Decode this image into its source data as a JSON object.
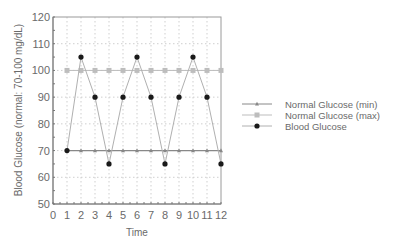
{
  "chart_data": {
    "type": "line",
    "title": "",
    "xlabel": "Time",
    "ylabel": "Blood Glucose (normal: 70-100 mg/dL)",
    "xlim": [
      0,
      12
    ],
    "ylim": [
      50,
      120
    ],
    "x_ticks": [
      "0",
      "1",
      "2",
      "3",
      "4",
      "5",
      "6",
      "7",
      "8",
      "9",
      "10",
      "11",
      "12"
    ],
    "y_ticks": [
      "50",
      "60",
      "70",
      "80",
      "90",
      "100",
      "110",
      "120"
    ],
    "grid": true,
    "legend_position": "right",
    "x": [
      1,
      2,
      3,
      4,
      5,
      6,
      7,
      8,
      9,
      10,
      11,
      12
    ],
    "series": [
      {
        "name": "Normal Glucose (min)",
        "color": "#888888",
        "marker": "triangle",
        "values": [
          70,
          70,
          70,
          70,
          70,
          70,
          70,
          70,
          70,
          70,
          70,
          70
        ]
      },
      {
        "name": "Normal Glucose (max)",
        "color": "#bdbdbd",
        "marker": "square",
        "values": [
          100,
          100,
          100,
          100,
          100,
          100,
          100,
          100,
          100,
          100,
          100,
          100
        ]
      },
      {
        "name": "Blood Glucose",
        "color": "#b0b0b0",
        "marker_color": "#1a1a1a",
        "marker": "circle",
        "values": [
          70,
          105,
          90,
          65,
          90,
          105,
          90,
          65,
          90,
          105,
          90,
          65
        ]
      }
    ]
  }
}
